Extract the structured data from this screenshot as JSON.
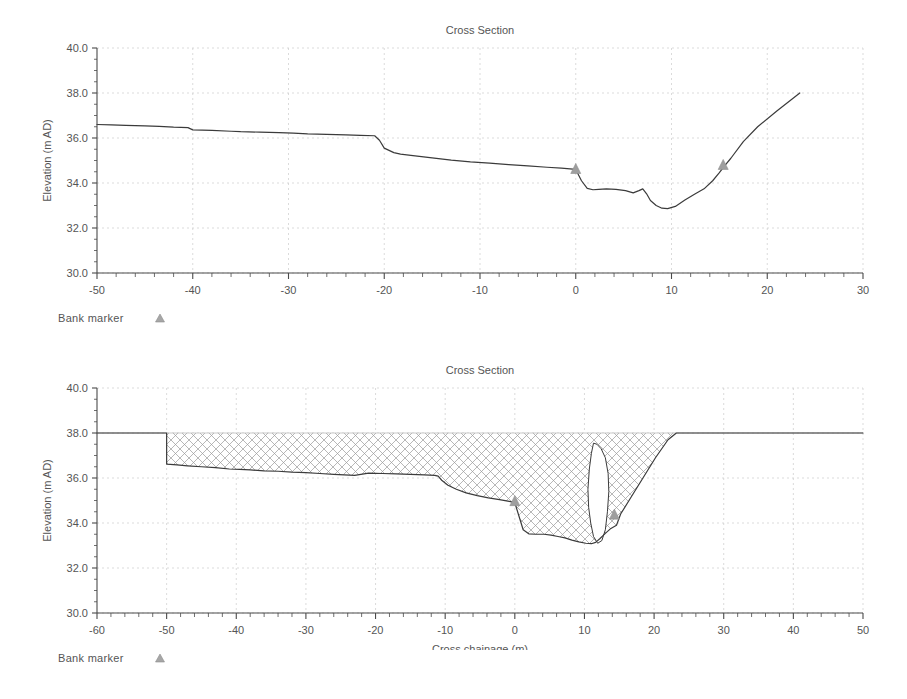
{
  "charts": [
    {
      "id": "cross-section-natural",
      "title": "Cross Section",
      "xlabel": "Cross chainage (m)",
      "ylabel": "Elevation (m AD)",
      "legend_label": "Bank marker",
      "legend_marker_icon": "triangle-marker-icon",
      "title_color": "#4a4a4a",
      "line_color": "#3b3b3b",
      "marker_color": "#9e9e9e",
      "grid_color": "#cccccc"
    },
    {
      "id": "cross-section-panelled",
      "title": "Cross Section",
      "xlabel": "Cross chainage (m)",
      "ylabel": "Elevation (m AD)",
      "legend_label": "Bank marker",
      "legend_marker_icon": "triangle-marker-icon",
      "title_color": "#9a9a9a",
      "line_color": "#3b3b3b",
      "marker_color": "#9e9e9e",
      "grid_color": "#cccccc",
      "hatch_color": "#9a9a9a"
    }
  ],
  "chart_data": [
    {
      "type": "line",
      "title": "Cross Section",
      "xlabel": "Cross chainage (m)",
      "ylabel": "Elevation (m AD)",
      "xlim": [
        -50,
        30
      ],
      "ylim": [
        30.0,
        40.0
      ],
      "xticks": [
        -50,
        -40,
        -30,
        -20,
        -10,
        0,
        10,
        20,
        30
      ],
      "yticks": [
        30.0,
        32.0,
        34.0,
        36.0,
        38.0,
        40.0
      ],
      "xtick_labels": [
        "-50",
        "-40",
        "-30",
        "-20",
        "-10",
        "0",
        "10",
        "20",
        "30"
      ],
      "ytick_labels": [
        "30.0",
        "32.0",
        "34.0",
        "36.0",
        "38.0",
        "40.0"
      ],
      "minor_tick_interval": 2,
      "grid": true,
      "legend": [
        "Bank marker"
      ],
      "legend_position": "below-left",
      "series": [
        {
          "name": "Ground level",
          "x": [
            -50.0,
            -48.5,
            -47.0,
            -45.0,
            -43.5,
            -42.0,
            -40.5,
            -40.0,
            -38.0,
            -36.0,
            -35.0,
            -33.0,
            -31.0,
            -29.5,
            -28.0,
            -26.0,
            -24.0,
            -22.5,
            -21.0,
            -20.5,
            -20.0,
            -19.0,
            -18.3,
            -17.0,
            -15.0,
            -13.0,
            -11.0,
            -9.0,
            -7.0,
            -5.0,
            -3.0,
            -1.5,
            -0.3,
            0.0,
            0.6,
            1.2,
            1.8,
            2.4,
            3.2,
            4.2,
            5.2,
            6.0,
            6.6,
            7.0,
            7.4,
            7.8,
            8.4,
            9.0,
            9.6,
            10.4,
            11.4,
            12.4,
            13.4,
            14.3,
            15.0,
            15.5,
            16.2,
            17.5,
            19.0,
            21.0,
            23.4
          ],
          "y": [
            36.6,
            36.58,
            36.56,
            36.54,
            36.52,
            36.48,
            36.46,
            36.36,
            36.34,
            36.3,
            36.28,
            36.26,
            36.24,
            36.22,
            36.18,
            36.16,
            36.14,
            36.12,
            36.1,
            35.9,
            35.55,
            35.35,
            35.28,
            35.22,
            35.12,
            35.02,
            34.94,
            34.88,
            34.82,
            34.76,
            34.7,
            34.66,
            34.62,
            34.6,
            34.1,
            33.76,
            33.7,
            33.72,
            33.74,
            33.72,
            33.66,
            33.56,
            33.66,
            33.74,
            33.52,
            33.22,
            33.0,
            32.88,
            32.86,
            32.96,
            33.24,
            33.5,
            33.74,
            34.1,
            34.46,
            34.74,
            35.1,
            35.84,
            36.5,
            37.2,
            38.0
          ]
        }
      ],
      "markers": [
        {
          "name": "bank-marker-left",
          "x": 0.0,
          "y": 34.6
        },
        {
          "name": "bank-marker-right",
          "x": 15.4,
          "y": 34.78
        }
      ]
    },
    {
      "type": "area",
      "title": "Cross Section",
      "xlabel": "Cross chainage (m)",
      "ylabel": "Elevation (m AD)",
      "xlim": [
        -60,
        50
      ],
      "ylim": [
        30.0,
        40.0
      ],
      "xticks": [
        -60,
        -50,
        -40,
        -30,
        -20,
        -10,
        0,
        10,
        20,
        30,
        40,
        50
      ],
      "yticks": [
        30.0,
        32.0,
        34.0,
        36.0,
        38.0,
        40.0
      ],
      "xtick_labels": [
        "-60",
        "-50",
        "-40",
        "-30",
        "-20",
        "-10",
        "0",
        "10",
        "20",
        "30",
        "40",
        "50"
      ],
      "ytick_labels": [
        "30.0",
        "32.0",
        "34.0",
        "36.0",
        "38.0",
        "40.0"
      ],
      "minor_tick_interval": 2,
      "grid": true,
      "legend": [
        "Bank marker"
      ],
      "legend_position": "below-left",
      "series": [
        {
          "name": "Ground level / extended section",
          "x": [
            -60.0,
            -50.0,
            -50.0,
            -48.5,
            -47.0,
            -45.0,
            -43.0,
            -41.0,
            -39.5,
            -38.0,
            -36.0,
            -34.0,
            -32.0,
            -30.0,
            -28.0,
            -26.0,
            -24.5,
            -23.0,
            -21.0,
            -19.0,
            -17.0,
            -15.0,
            -13.0,
            -11.5,
            -11.0,
            -10.5,
            -9.6,
            -8.4,
            -7.0,
            -5.4,
            -3.8,
            -2.2,
            -0.8,
            -0.1,
            0.0,
            0.6,
            1.2,
            2.0,
            3.0,
            4.2,
            5.2,
            6.2,
            7.2,
            8.2,
            9.2,
            10.2,
            11.0,
            11.6,
            12.2,
            13.0,
            13.8,
            14.6,
            15.2,
            16.6,
            18.4,
            20.2,
            22.0,
            23.2,
            25.0,
            30.0,
            35.0,
            40.0,
            45.0,
            50.0
          ],
          "y": [
            38.0,
            38.0,
            36.62,
            36.58,
            36.54,
            36.5,
            36.46,
            36.4,
            36.38,
            36.36,
            36.32,
            36.3,
            36.26,
            36.24,
            36.2,
            36.16,
            36.14,
            36.12,
            36.22,
            36.2,
            36.18,
            36.16,
            36.14,
            36.12,
            36.08,
            35.9,
            35.68,
            35.5,
            35.34,
            35.22,
            35.12,
            35.04,
            34.96,
            34.92,
            34.9,
            34.3,
            33.7,
            33.52,
            33.5,
            33.5,
            33.46,
            33.4,
            33.34,
            33.24,
            33.16,
            33.1,
            33.08,
            33.14,
            33.3,
            33.54,
            33.76,
            33.9,
            34.4,
            35.1,
            36.0,
            36.9,
            37.7,
            38.0,
            38.0,
            38.0,
            38.0,
            38.0,
            38.0,
            38.0
          ]
        }
      ],
      "water_level": 38.0,
      "panel_outline": {
        "name": "flow-panel-outline",
        "x": [
          11.3,
          11.0,
          10.7,
          10.5,
          10.6,
          10.9,
          11.3,
          11.9,
          12.5,
          13.0,
          13.3,
          13.5,
          13.4,
          13.0,
          12.4,
          11.8,
          11.3
        ],
        "y": [
          37.55,
          37.1,
          36.4,
          35.5,
          34.7,
          34.0,
          33.4,
          33.1,
          33.22,
          33.7,
          34.5,
          35.4,
          36.2,
          36.9,
          37.3,
          37.5,
          37.55
        ]
      },
      "markers": [
        {
          "name": "bank-marker-left",
          "x": 0.0,
          "y": 34.95
        },
        {
          "name": "bank-marker-right",
          "x": 14.3,
          "y": 34.35
        }
      ]
    }
  ]
}
